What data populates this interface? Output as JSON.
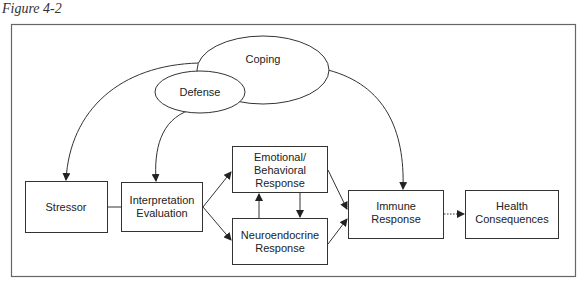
{
  "figure": {
    "title": "Figure 4-2",
    "caption": ""
  },
  "nodes": {
    "coping": {
      "lines": [
        "Coping"
      ]
    },
    "defense": {
      "lines": [
        "Defense"
      ]
    },
    "stressor": {
      "lines": [
        "Stressor"
      ]
    },
    "interpretation": {
      "lines": [
        "Interpretation",
        "Evaluation"
      ]
    },
    "emotional": {
      "lines": [
        "Emotional/",
        "Behavioral",
        "Response"
      ]
    },
    "neuroendocrine": {
      "lines": [
        "Neuroendocrine",
        "Response"
      ]
    },
    "immune": {
      "lines": [
        "Immune",
        "Response"
      ]
    },
    "health": {
      "lines": [
        "Health",
        "Consequences"
      ]
    }
  },
  "edges": [
    {
      "from": "coping",
      "to": "stressor",
      "style": "solid",
      "shape": "curve"
    },
    {
      "from": "defense",
      "to": "interpretation",
      "style": "solid",
      "shape": "curve"
    },
    {
      "from": "coping",
      "to": "immune",
      "style": "solid",
      "shape": "curve"
    },
    {
      "from": "stressor",
      "to": "interpretation",
      "style": "solid",
      "shape": "line",
      "arrow": false
    },
    {
      "from": "interpretation",
      "to": "emotional",
      "style": "solid",
      "shape": "line"
    },
    {
      "from": "interpretation",
      "to": "neuroendocrine",
      "style": "solid",
      "shape": "line"
    },
    {
      "from": "neuroendocrine",
      "to": "emotional",
      "style": "solid",
      "shape": "line"
    },
    {
      "from": "emotional",
      "to": "neuroendocrine",
      "style": "solid",
      "shape": "line"
    },
    {
      "from": "emotional",
      "to": "immune",
      "style": "solid",
      "shape": "line"
    },
    {
      "from": "neuroendocrine",
      "to": "immune",
      "style": "solid",
      "shape": "line"
    },
    {
      "from": "immune",
      "to": "health",
      "style": "dotted",
      "shape": "line"
    }
  ],
  "colors": {
    "stroke": "#333333",
    "frame": "#666666",
    "background": "#ffffff"
  }
}
